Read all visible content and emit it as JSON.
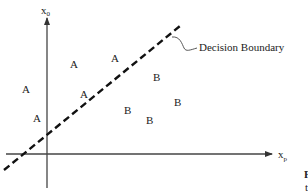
{
  "diagram": {
    "type": "linear-decision-boundary",
    "axes": {
      "y_axis": {
        "label": "x",
        "subscript": "0"
      },
      "x_axis": {
        "label": "x",
        "subscript": "p"
      }
    },
    "boundary": {
      "label": "Decision Boundary",
      "style": "dashed"
    },
    "class_a": {
      "label": "A",
      "points": [
        {
          "x": 100,
          "y": 63
        },
        {
          "x": 146,
          "y": 58
        },
        {
          "x": 26,
          "y": 90
        },
        {
          "x": 85,
          "y": 95
        },
        {
          "x": 36,
          "y": 120
        }
      ]
    },
    "class_b": {
      "label": "B",
      "points": [
        {
          "x": 156,
          "y": 81
        },
        {
          "x": 178,
          "y": 104
        },
        {
          "x": 127,
          "y": 112
        },
        {
          "x": 150,
          "y": 123
        }
      ]
    },
    "cut_off_text": {
      "line1": "F",
      "line2": "t"
    }
  }
}
